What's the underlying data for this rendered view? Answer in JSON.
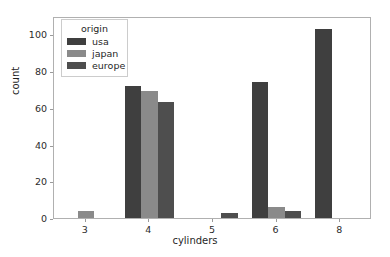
{
  "chart_data": {
    "type": "bar",
    "title": "",
    "subtitle": "",
    "xlabel": "cylinders",
    "ylabel": "count",
    "categories": [
      "3",
      "4",
      "5",
      "6",
      "8"
    ],
    "series": [
      {
        "name": "usa",
        "color": "#3f3f3f",
        "values": [
          0,
          72,
          0,
          74,
          103
        ]
      },
      {
        "name": "japan",
        "color": "#8a8a8a",
        "values": [
          4,
          69,
          0,
          6,
          0
        ]
      },
      {
        "name": "europe",
        "color": "#4e4e4e",
        "values": [
          0,
          63,
          3,
          4,
          0
        ]
      }
    ],
    "ylim": [
      0,
      110
    ],
    "yticks": [
      0,
      20,
      40,
      60,
      80,
      100
    ],
    "ytick_labels": [
      "0",
      "20",
      "40",
      "60",
      "80",
      "100"
    ],
    "xtick_labels": [
      "3",
      "4",
      "5",
      "6",
      "8"
    ],
    "grid": false,
    "legend": {
      "title": "origin",
      "position": "upper left",
      "entries": [
        "usa",
        "japan",
        "europe"
      ]
    }
  },
  "figure": {
    "background_color": "#ffffff",
    "axes_edge_color": "#b0b0b0",
    "tick_color": "#9a9a9a",
    "text_color": "#1f1f1f"
  }
}
